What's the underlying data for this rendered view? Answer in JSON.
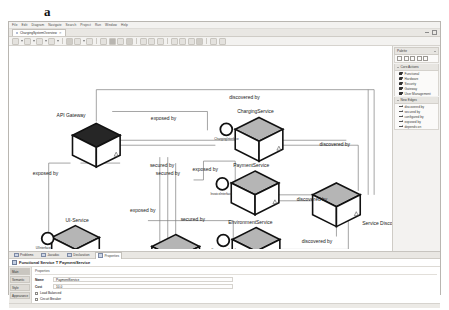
{
  "figure": {
    "label": "a",
    "caption": "b"
  },
  "menubar": {
    "items": [
      "File",
      "Edit",
      "Diagram",
      "Navigate",
      "Search",
      "Project",
      "Run",
      "Window",
      "Help"
    ]
  },
  "editor_tab": {
    "name": "ChargingSystemOverview",
    "close": "✕",
    "dirty_marker": "*"
  },
  "tabstrip_right": {
    "minimize": "minimize-control",
    "maximize": "maximize-control"
  },
  "toolbar": {
    "groups": [
      {
        "buttons": [
          "select-tool",
          "marquee-tool",
          "caret-1",
          "zoom-tool",
          "caret-2",
          "layout-tool",
          "caret-3"
        ]
      },
      {
        "buttons": [
          "font-name",
          "font-size",
          "caret-4",
          "bold",
          "italic",
          "underline"
        ]
      },
      {
        "buttons": [
          "fill-color",
          "line-color",
          "font-color",
          "align-left",
          "align-center",
          "align-right"
        ]
      },
      {
        "buttons": [
          "arrange-send-back",
          "arrange-bring-front",
          "snap-grid",
          "ruler-toggle",
          "grid-toggle"
        ]
      },
      {
        "buttons": [
          "export-image",
          "print-diagram"
        ]
      }
    ]
  },
  "palette": {
    "title": "Palette",
    "collapse_icon": "chevron-icon",
    "tools_row": [
      "select-arrow",
      "marquee",
      "note",
      "note-attachment",
      "connection"
    ],
    "sections": [
      {
        "title": "Core Actions",
        "items": [
          {
            "label": "Functional",
            "icon": "cube-light-icon"
          },
          {
            "label": "Hardware",
            "icon": "cube-light-icon"
          },
          {
            "label": "Security",
            "icon": "cube-light-icon"
          },
          {
            "label": "Gateway",
            "icon": "cube-dark-icon"
          },
          {
            "label": "User Management",
            "icon": "cube-dark-icon"
          }
        ]
      },
      {
        "title": "New Edges",
        "items": [
          {
            "label": "discovered by",
            "icon": "arrow-icon"
          },
          {
            "label": "secured by",
            "icon": "arrow-icon"
          },
          {
            "label": "configured by",
            "icon": "arrow-icon"
          },
          {
            "label": "exposed by",
            "icon": "arrow-icon"
          },
          {
            "label": "depends on",
            "icon": "arrow-icon"
          }
        ]
      }
    ]
  },
  "properties_panel": {
    "tabs": [
      {
        "label": "Problems",
        "active": false
      },
      {
        "label": "Javadoc",
        "active": false
      },
      {
        "label": "Declaration",
        "active": false
      },
      {
        "label": "Properties",
        "active": true
      }
    ],
    "header_icon": "functional-service-icon",
    "header_title": "Functional Service T PaymentService",
    "sections": [
      "Main",
      "Semantic",
      "Style",
      "Appearance"
    ],
    "active_section": "Main",
    "group_label": "Properties",
    "fields": [
      {
        "label": "Name",
        "value": "PaymentService"
      },
      {
        "label": "Cost",
        "value": "10.0"
      }
    ],
    "checkboxes": [
      {
        "label": "Load Balanced",
        "checked": false
      },
      {
        "label": "Circuit Breaker",
        "checked": false
      }
    ]
  },
  "diagram": {
    "nodes": [
      {
        "id": "api-gateway",
        "label": "API Gateway",
        "style": "dark",
        "x": 88,
        "y": 100,
        "label_dx": -40,
        "label_dy": -28
      },
      {
        "id": "charging-service",
        "label": "ChargingService",
        "style": "gray",
        "x": 252,
        "y": 94,
        "label_dx": -22,
        "label_dy": -26
      },
      {
        "id": "payment-service",
        "label": "PaymentService",
        "style": "gray",
        "x": 248,
        "y": 148,
        "label_dx": -22,
        "label_dy": -26
      },
      {
        "id": "environment-service",
        "label": "EnvironmentService",
        "style": "gray",
        "x": 249,
        "y": 205,
        "label_dx": -28,
        "label_dy": -26
      },
      {
        "id": "security-service",
        "label": "SecurityService",
        "style": "gray",
        "x": 168,
        "y": 212,
        "label_dx": -52,
        "label_dy": 6
      },
      {
        "id": "ui-service",
        "label": "UI-Service",
        "style": "gray",
        "x": 67,
        "y": 203,
        "label_dx": -10,
        "label_dy": -26
      },
      {
        "id": "service-discovery",
        "label": "Service Discovery",
        "style": "gray",
        "x": 330,
        "y": 160,
        "label_dx": 26,
        "label_dy": 20
      }
    ],
    "interfaces": [
      {
        "id": "charging-interface",
        "label": "ChargingInterface",
        "x": 219,
        "y": 84
      },
      {
        "id": "invoice-interface",
        "label": "InvoiceInterface",
        "x": 215,
        "y": 139
      },
      {
        "id": "environment-interface",
        "label": "EnvironmentInterface",
        "x": 216,
        "y": 196
      },
      {
        "id": "ui-interface",
        "label": "UIInterface",
        "x": 39,
        "y": 194
      }
    ],
    "edge_labels": [
      {
        "text": "discovered by",
        "x": 222,
        "y": 53
      },
      {
        "text": "exposed by",
        "x": 143,
        "y": 75
      },
      {
        "text": "discovered by",
        "x": 313,
        "y": 101
      },
      {
        "text": "exposed by",
        "x": 24,
        "y": 130
      },
      {
        "text": "secured by",
        "x": 142,
        "y": 122
      },
      {
        "text": "secured by",
        "x": 148,
        "y": 130
      },
      {
        "text": "exposed by",
        "x": 185,
        "y": 126
      },
      {
        "text": "discovered by",
        "x": 290,
        "y": 156
      },
      {
        "text": "exposed by",
        "x": 122,
        "y": 167
      },
      {
        "text": "secured by",
        "x": 173,
        "y": 176
      },
      {
        "text": "discovered by",
        "x": 295,
        "y": 199
      },
      {
        "text": "secured by",
        "x": 197,
        "y": 229
      }
    ]
  }
}
